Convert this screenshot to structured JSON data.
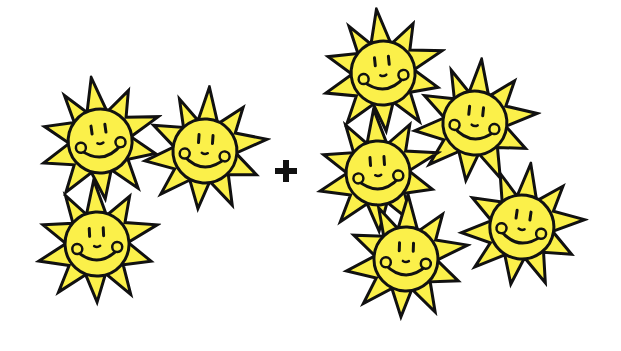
{
  "illustration": {
    "description": "Addition of smiling suns: 3 + 5",
    "operator": "+",
    "colors": {
      "sun_fill": "#fbf04a",
      "outline": "#111111",
      "background": "#ffffff"
    },
    "left_group": {
      "count": 3,
      "suns": [
        {
          "cx": 100,
          "cy": 140,
          "rot": -8,
          "scale": 1.0
        },
        {
          "cx": 205,
          "cy": 150,
          "rot": 4,
          "scale": 1.0
        },
        {
          "cx": 97,
          "cy": 243,
          "rot": -3,
          "scale": 1.0
        }
      ]
    },
    "right_group": {
      "count": 5,
      "suns": [
        {
          "cx": 383,
          "cy": 72,
          "rot": -6,
          "scale": 1.0
        },
        {
          "cx": 475,
          "cy": 122,
          "rot": 6,
          "scale": 1.0
        },
        {
          "cx": 378,
          "cy": 172,
          "rot": -4,
          "scale": 1.0
        },
        {
          "cx": 406,
          "cy": 258,
          "rot": 2,
          "scale": 1.0
        },
        {
          "cx": 522,
          "cy": 226,
          "rot": 8,
          "scale": 1.0
        }
      ]
    },
    "plus": {
      "x": 286,
      "y": 171
    }
  }
}
